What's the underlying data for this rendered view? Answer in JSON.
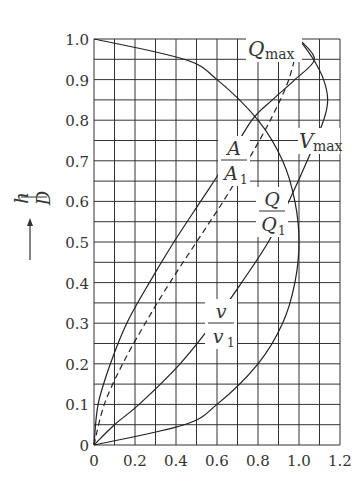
{
  "chart_data": {
    "type": "line",
    "title": "",
    "xlabel": "",
    "ylabel": "h/D",
    "xlim": [
      0,
      1.2
    ],
    "ylim": [
      0,
      1.0
    ],
    "grid": true,
    "x_ticks": [
      "0",
      "0.2",
      "0.4",
      "0.6",
      "0.8",
      "1.0",
      "1.2"
    ],
    "y_ticks": [
      "0",
      "0.1",
      "0.2",
      "0.3",
      "0.4",
      "0.5",
      "0.6",
      "0.7",
      "0.8",
      "0.9",
      "1.0"
    ],
    "series": [
      {
        "name": "A/A1",
        "style": "dashed",
        "points": [
          [
            0,
            0
          ],
          [
            0.05,
            0.1
          ],
          [
            0.14,
            0.2
          ],
          [
            0.25,
            0.3
          ],
          [
            0.37,
            0.4
          ],
          [
            0.5,
            0.5
          ],
          [
            0.63,
            0.6
          ],
          [
            0.75,
            0.7
          ],
          [
            0.86,
            0.8
          ],
          [
            0.95,
            0.9
          ],
          [
            1.0,
            1.0
          ]
        ]
      },
      {
        "name": "Q/Q1",
        "style": "solid",
        "points": [
          [
            0,
            0
          ],
          [
            0.02,
            0.1
          ],
          [
            0.08,
            0.2
          ],
          [
            0.16,
            0.3
          ],
          [
            0.27,
            0.4
          ],
          [
            0.39,
            0.5
          ],
          [
            0.52,
            0.6
          ],
          [
            0.65,
            0.7
          ],
          [
            0.77,
            0.8
          ],
          [
            0.87,
            0.85
          ],
          [
            0.98,
            0.9
          ],
          [
            1.075,
            0.95
          ],
          [
            1.0,
            1.0
          ]
        ]
      },
      {
        "name": "v/v1",
        "style": "solid",
        "points": [
          [
            0,
            0
          ],
          [
            0.1,
            0.05
          ],
          [
            0.22,
            0.1
          ],
          [
            0.42,
            0.2
          ],
          [
            0.58,
            0.3
          ],
          [
            0.72,
            0.4
          ],
          [
            0.85,
            0.5
          ],
          [
            0.95,
            0.6
          ],
          [
            1.04,
            0.7
          ],
          [
            1.12,
            0.8
          ],
          [
            1.14,
            0.85
          ],
          [
            1.12,
            0.9
          ],
          [
            1.07,
            0.95
          ],
          [
            1.0,
            1.0
          ]
        ]
      },
      {
        "name": "section-arc",
        "style": "solid",
        "points": [
          [
            0,
            1.0
          ],
          [
            0.44,
            0.95
          ],
          [
            0.6,
            0.9
          ],
          [
            0.8,
            0.8
          ],
          [
            0.92,
            0.7
          ],
          [
            0.98,
            0.6
          ],
          [
            1.0,
            0.5
          ],
          [
            0.98,
            0.4
          ],
          [
            0.92,
            0.3
          ],
          [
            0.8,
            0.2
          ],
          [
            0.6,
            0.1
          ],
          [
            0.44,
            0.05
          ],
          [
            0,
            0
          ]
        ]
      }
    ],
    "annotations": [
      {
        "text": "Q_max",
        "x": 0.83,
        "y": 0.98
      },
      {
        "text": "A/A1",
        "x": 0.65,
        "y": 0.72
      },
      {
        "text": "V_max",
        "x": 1.0,
        "y": 0.73
      },
      {
        "text": "Q/Q1",
        "x": 0.75,
        "y": 0.55
      },
      {
        "text": "v/v1",
        "x": 0.52,
        "y": 0.27
      }
    ]
  },
  "labels": {
    "ylabel_num": "h",
    "ylabel_den": "D",
    "qmax": "Q",
    "qmax_sub": "max",
    "vmax": "V",
    "vmax_sub": "max",
    "a_num": "A",
    "a_den": "A",
    "a_den_sub": "1",
    "q_num": "Q",
    "q_den": "Q",
    "q_den_sub": "1",
    "v_num": "v",
    "v_den": "v",
    "v_den_sub": "1"
  }
}
